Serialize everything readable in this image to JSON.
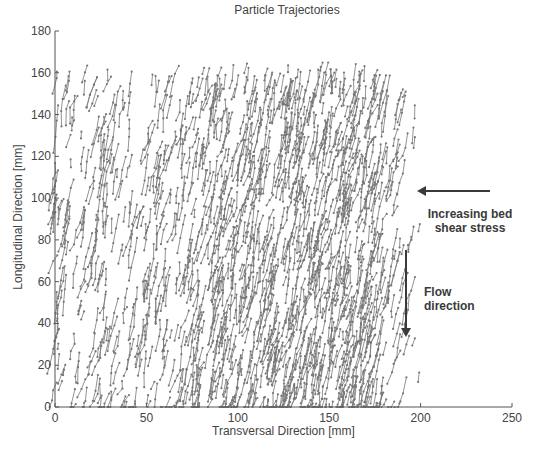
{
  "chart_data": {
    "type": "scatter",
    "title": "Particle Trajectories",
    "xlabel": "Transversal Direction [mm]",
    "ylabel": "Longitudinal Direction [mm]",
    "xlim": [
      0,
      250
    ],
    "ylim": [
      0,
      180
    ],
    "xticks": [
      0,
      50,
      100,
      150,
      200,
      250
    ],
    "yticks": [
      0,
      20,
      40,
      60,
      80,
      100,
      120,
      140,
      160,
      180
    ],
    "grid": false,
    "legend": null,
    "series": [
      {
        "name": "particle trajectories",
        "style": "short line segments with point markers",
        "color": "#777777",
        "description": "Dense field of short particle paths oriented mostly downward (negative longitudinal) with a slight leftward drift; particle density increases from x=0 toward x≈150–185 mm, data ends near x≈200 mm; y range ≈0–165 mm",
        "x_extent": [
          0,
          200
        ],
        "y_extent": [
          0,
          165
        ],
        "density_profile": {
          "x": [
            0,
            25,
            50,
            75,
            100,
            125,
            150,
            175,
            190,
            200
          ],
          "relative_density": [
            0.25,
            0.3,
            0.35,
            0.5,
            0.7,
            0.9,
            1.0,
            0.8,
            0.25,
            0.05
          ]
        },
        "typical_step_mm": {
          "dx": -1.5,
          "dy": -6
        }
      }
    ],
    "annotations": [
      {
        "text": "Increasing bed shear stress",
        "arrow": "left",
        "position_mm": [
          200,
          100
        ]
      },
      {
        "text": "Flow direction",
        "arrow": "down",
        "position_mm": [
          190,
          75
        ]
      }
    ]
  },
  "labels": {
    "title": "Particle Trajectories",
    "xlabel": "Transversal Direction [mm]",
    "ylabel": "Longitudinal Direction [mm]",
    "shear_line1": "Increasing bed",
    "shear_line2": "shear stress",
    "flow_line1": "Flow",
    "flow_line2": "direction"
  },
  "colors": {
    "particles": "#777777",
    "axis": "#555555",
    "arrow": "#3a3a3a"
  }
}
